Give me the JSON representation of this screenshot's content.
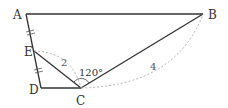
{
  "diagram": {
    "points": {
      "A": {
        "label": "A",
        "x": 26,
        "y": 14
      },
      "B": {
        "label": "B",
        "x": 203,
        "y": 14
      },
      "E": {
        "label": "E",
        "x": 34,
        "y": 51
      },
      "D": {
        "label": "D",
        "x": 41,
        "y": 88
      },
      "C": {
        "label": "C",
        "x": 81,
        "y": 88
      }
    },
    "annotations": {
      "ec_length": "2",
      "cb_length": "4",
      "angle_ecb": "120°"
    },
    "colors": {
      "stroke": "#333333",
      "dotted": "#aaaaaa"
    }
  }
}
